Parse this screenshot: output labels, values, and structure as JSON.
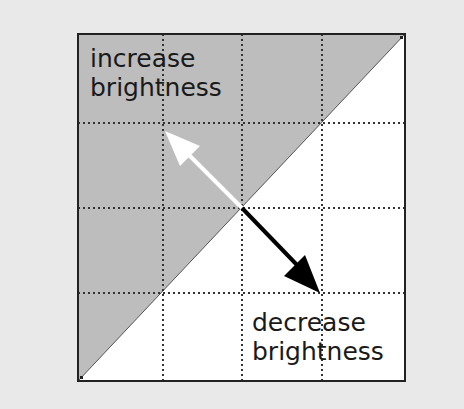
{
  "diagram": {
    "labels": {
      "top_left_line1": "increase",
      "top_left_line2": "brightness",
      "bottom_right_line1": "decrease",
      "bottom_right_line2": "brightness"
    },
    "corner_markers": {
      "top_right": "2",
      "bottom_left": "1"
    },
    "colors": {
      "background": "#e9e9e9",
      "shaded_region": "#bdbdbd",
      "unshaded_region": "#ffffff",
      "increase_arrow": "#ffffff",
      "decrease_arrow": "#000000",
      "grid_lines": "#333333"
    },
    "grid": {
      "rows": 4,
      "cols": 4
    }
  }
}
